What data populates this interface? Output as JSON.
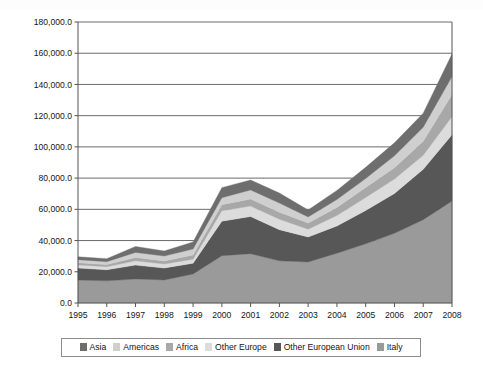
{
  "chart_data": {
    "type": "area",
    "stacked": true,
    "title": "",
    "subtitle": "",
    "xlabel": "",
    "ylabel": "",
    "grid": true,
    "legend_position": "bottom",
    "categories": [
      "1995",
      "1996",
      "1997",
      "1998",
      "1999",
      "2000",
      "2001",
      "2002",
      "2003",
      "2004",
      "2005",
      "2006",
      "2007",
      "2008"
    ],
    "x": [
      1995,
      1996,
      1997,
      1998,
      1999,
      2000,
      2001,
      2002,
      2003,
      2004,
      2005,
      2006,
      2007,
      2008
    ],
    "xlim": [
      1995,
      2008
    ],
    "ylim": [
      0,
      180000
    ],
    "ytick_values": [
      0,
      20000,
      40000,
      60000,
      80000,
      100000,
      120000,
      140000,
      160000,
      180000
    ],
    "ytick_labels": [
      "0.0",
      "20,000.0",
      "40,000.0",
      "60,000.0",
      "80,000.0",
      "100,000.0",
      "120,000.0",
      "140,000.0",
      "160,000.0",
      "180,000.0"
    ],
    "stack_order_bottom_to_top": [
      "Italy",
      "Other European Union",
      "Other Europe",
      "Africa",
      "Americas",
      "Asia"
    ],
    "series": [
      {
        "name": "Italy",
        "color": "#9a9a9a",
        "values": [
          14700,
          14200,
          15400,
          14800,
          18600,
          30300,
          31600,
          27000,
          26300,
          31900,
          37900,
          44600,
          53400,
          65300
        ]
      },
      {
        "name": "Other European Union",
        "color": "#575757",
        "values": [
          7700,
          7100,
          8900,
          7600,
          6900,
          22100,
          23800,
          20000,
          16000,
          17500,
          21400,
          25600,
          32200,
          42500
        ]
      },
      {
        "name": "Other Europe",
        "color": "#dcdcdc",
        "values": [
          2000,
          1900,
          2700,
          2600,
          2600,
          6700,
          6700,
          6700,
          5000,
          6700,
          8300,
          9300,
          9000,
          11600
        ]
      },
      {
        "name": "Africa",
        "color": "#a8a8a8",
        "values": [
          1400,
          1400,
          2200,
          1900,
          2600,
          3900,
          4500,
          4500,
          3900,
          5100,
          6400,
          7100,
          9000,
          14100
        ]
      },
      {
        "name": "Americas",
        "color": "#cfcfcf",
        "values": [
          1900,
          1900,
          3200,
          3200,
          3900,
          4500,
          5800,
          5800,
          3900,
          5100,
          5800,
          7700,
          9000,
          11600
        ]
      },
      {
        "name": "Asia",
        "color": "#6e6e6e",
        "values": [
          1900,
          1900,
          3800,
          3200,
          4500,
          6400,
          6400,
          6400,
          4500,
          5800,
          7100,
          8300,
          9000,
          14400
        ]
      }
    ],
    "totals": [
      29600,
      28400,
      36200,
      33300,
      39100,
      73900,
      78800,
      70400,
      59600,
      72100,
      86900,
      102600,
      121600,
      159500
    ]
  },
  "legend": {
    "items": [
      {
        "label": "Asia",
        "color": "#6e6e6e"
      },
      {
        "label": "Americas",
        "color": "#cfcfcf"
      },
      {
        "label": "Africa",
        "color": "#a8a8a8"
      },
      {
        "label": "Other Europe",
        "color": "#dcdcdc"
      },
      {
        "label": "Other European Union",
        "color": "#575757"
      },
      {
        "label": "Italy",
        "color": "#9a9a9a"
      }
    ]
  },
  "axes": {
    "axis_line_color": "#555555",
    "grid_line_color": "#6b6b6b",
    "plot_background": "#ffffff"
  }
}
